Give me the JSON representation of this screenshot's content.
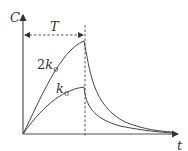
{
  "diagram": {
    "y_axis_label": "C",
    "x_axis_label": "t",
    "interval_label": "T",
    "curves": [
      {
        "coef": "2",
        "symbol": "k",
        "subscript": "0",
        "label": "2k0"
      },
      {
        "coef": "",
        "symbol": "k",
        "subscript": "0",
        "label": "k0"
      }
    ],
    "colors": {
      "line": "#444444",
      "background": "#ffffff"
    }
  }
}
